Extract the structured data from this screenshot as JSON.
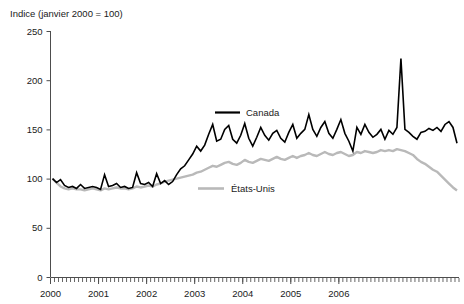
{
  "chart_data": {
    "type": "line",
    "title": "Indice (janvier 2000 = 100)",
    "ylabel": "Indice (janvier 2000 = 100)",
    "xlabel": "",
    "ylim": [
      0,
      250
    ],
    "yticks": [
      0,
      50,
      100,
      150,
      200,
      250
    ],
    "ytick_labels": [
      "0",
      "50",
      "100",
      "150",
      "200",
      "250"
    ],
    "xlim": [
      "2000-01",
      "2006-12"
    ],
    "xticks": [
      2000,
      2001,
      2002,
      2003,
      2004,
      2005,
      2006
    ],
    "xtick_labels": [
      "2000",
      "2001",
      "2002",
      "2003",
      "2004",
      "2005",
      "2006"
    ],
    "minor_xticks": "monthly",
    "grid": false,
    "legend_position": "inside-plot",
    "series": [
      {
        "name": "Canada",
        "color": "#000000",
        "label_x": 2004.05,
        "label_y": 168,
        "values": [
          100,
          96,
          99,
          93,
          91,
          92,
          90,
          94,
          90,
          91,
          92,
          91,
          89,
          104,
          92,
          93,
          95,
          91,
          92,
          90,
          91,
          106,
          95,
          94,
          96,
          92,
          105,
          95,
          98,
          94,
          97,
          104,
          110,
          113,
          119,
          125,
          133,
          128,
          134,
          145,
          155,
          138,
          140,
          150,
          154,
          140,
          136,
          144,
          156,
          141,
          133,
          142,
          152,
          144,
          139,
          146,
          149,
          141,
          137,
          147,
          155,
          141,
          146,
          150,
          165,
          150,
          143,
          152,
          158,
          146,
          141,
          150,
          160,
          146,
          138,
          128,
          152,
          145,
          155,
          147,
          142,
          145,
          150,
          140,
          149,
          145,
          152,
          222,
          150,
          147,
          143,
          140,
          147,
          148,
          151,
          149,
          152,
          148,
          155,
          158,
          152,
          136
        ]
      },
      {
        "name": "États-Unis",
        "color": "#b9b9b9",
        "label_x": 2003.2,
        "label_y": 63,
        "values": [
          100,
          96,
          92,
          90,
          89,
          90,
          89,
          89,
          88,
          89,
          90,
          89,
          88,
          90,
          89,
          90,
          91,
          90,
          90,
          89,
          90,
          92,
          91,
          92,
          93,
          92,
          94,
          95,
          97,
          98,
          99,
          100,
          101,
          102,
          103,
          104,
          106,
          107,
          109,
          111,
          113,
          112,
          114,
          116,
          117,
          115,
          114,
          116,
          119,
          117,
          116,
          118,
          120,
          119,
          118,
          120,
          122,
          120,
          119,
          121,
          123,
          121,
          123,
          124,
          126,
          124,
          123,
          125,
          127,
          125,
          124,
          126,
          127,
          125,
          123,
          124,
          127,
          126,
          128,
          127,
          126,
          127,
          129,
          128,
          129,
          128,
          130,
          129,
          128,
          126,
          124,
          120,
          117,
          115,
          112,
          109,
          107,
          103,
          99,
          95,
          91,
          88
        ]
      }
    ]
  },
  "legend": {
    "canada_label": "Canada",
    "us_label": "États-Unis"
  }
}
